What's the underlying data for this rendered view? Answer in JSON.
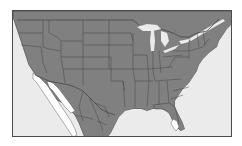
{
  "map": {
    "title": "Map of the contiguous United States with highlighted range regions",
    "colors": {
      "ocean": "#ebebeb",
      "land": "#808080",
      "state_border": "#3f3f3f",
      "highlight": "#ffffff",
      "frame": "#4a4a4a",
      "lakes": "#ebebeb"
    },
    "highlighted_regions": [
      {
        "name": "Baja California / southern California coast and Sonora",
        "fill": "#ffffff"
      },
      {
        "name": "Southern Florida tip",
        "fill": "#ffffff"
      }
    ],
    "features": [
      "United States states",
      "Canada (north)",
      "Mexico (south)",
      "Great Lakes",
      "Atlantic Ocean",
      "Pacific Ocean",
      "Gulf of Mexico"
    ]
  }
}
